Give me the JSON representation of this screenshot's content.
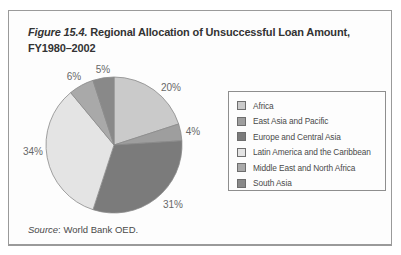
{
  "figure": {
    "title_label": "Figure 15.4.",
    "title_line1": "Regional Allocation of Unsuccessful Loan Amount,",
    "title_line2": "FY1980–2002",
    "source_prefix": "Source",
    "source_rest": ": World Bank OED."
  },
  "chart_data": {
    "type": "pie",
    "title": "Figure 15.4. Regional Allocation of Unsuccessful Loan Amount, FY1980–2002",
    "source": "Source: World Bank OED.",
    "start_angle_deg": 0,
    "direction": "clockwise",
    "legend_position": "right",
    "slice_outline_color": "#8a8a8a",
    "slices": [
      {
        "label": "Africa",
        "value": 20,
        "display": "20%",
        "color": "#cacaca"
      },
      {
        "label": "East Asia and Pacific",
        "value": 4,
        "display": "4%",
        "color": "#9e9e9e"
      },
      {
        "label": "Europe and Central Asia",
        "value": 31,
        "display": "31%",
        "color": "#7b7b7b"
      },
      {
        "label": "Latin America and the Caribbean",
        "value": 34,
        "display": "34%",
        "color": "#e4e4e4"
      },
      {
        "label": "Middle East and North Africa",
        "value": 6,
        "display": "6%",
        "color": "#a9a9a9"
      },
      {
        "label": "South Asia",
        "value": 5,
        "display": "5%",
        "color": "#898989"
      }
    ]
  }
}
